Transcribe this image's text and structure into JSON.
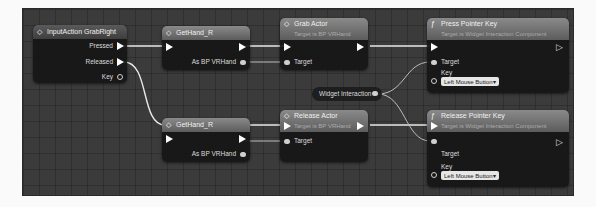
{
  "graph": {
    "nodes": {
      "input_action": {
        "title": "InputAction GrabRight",
        "pins": {
          "pressed": "Pressed",
          "released": "Released",
          "key": "Key"
        }
      },
      "get_hand_top": {
        "title": "GetHand_R",
        "output": "As BP VRHand"
      },
      "grab_actor": {
        "title": "Grab Actor",
        "subtitle": "Target is BP VRHand",
        "target": "Target"
      },
      "press_pointer_key": {
        "title": "Press Pointer Key",
        "subtitle": "Target is Widget Interaction Component",
        "target": "Target",
        "key_label": "Key",
        "key_value": "Left Mouse Button"
      },
      "widget_interaction": {
        "title": "Widget Interaction"
      },
      "get_hand_bottom": {
        "title": "GetHand_R",
        "output": "As BP VRHand"
      },
      "release_actor": {
        "title": "Release Actor",
        "subtitle": "Target is BP VRHand",
        "target": "Target"
      },
      "release_pointer_key": {
        "title": "Release Pointer Key",
        "subtitle": "Target is Widget Interaction Component",
        "target": "Target",
        "key_label": "Key",
        "key_value": "Left Mouse Button"
      }
    },
    "icons": {
      "event": "◇",
      "function": "ƒ",
      "dropdown": "▾"
    }
  }
}
